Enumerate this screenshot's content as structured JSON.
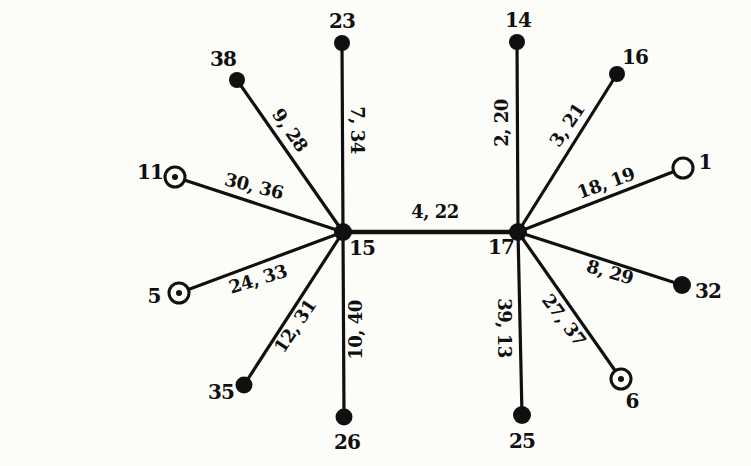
{
  "figure": {
    "type": "graph-diagram",
    "background_color": "#fcfcf9",
    "ink_color": "#101010"
  },
  "nodes": [
    {
      "id": "15",
      "label": "15",
      "x": 343,
      "y": 232,
      "style": "filled",
      "r": 9,
      "lx": 362,
      "ly": 248
    },
    {
      "id": "17",
      "label": "17",
      "x": 518,
      "y": 232,
      "style": "filled",
      "r": 9,
      "lx": 501,
      "ly": 247
    },
    {
      "id": "23",
      "label": "23",
      "x": 342,
      "y": 43,
      "style": "filled",
      "r": 8,
      "lx": 342,
      "ly": 21
    },
    {
      "id": "38",
      "label": "38",
      "x": 237,
      "y": 80,
      "style": "filled",
      "r": 8,
      "lx": 223,
      "ly": 59
    },
    {
      "id": "11",
      "label": "11",
      "x": 175,
      "y": 177,
      "style": "circled-dot",
      "r": 10,
      "lx": 150,
      "ly": 172
    },
    {
      "id": "5",
      "label": "5",
      "x": 179,
      "y": 293,
      "style": "circled-dot",
      "r": 10,
      "lx": 154,
      "ly": 296
    },
    {
      "id": "35",
      "label": "35",
      "x": 244,
      "y": 385,
      "style": "filled",
      "r": 8.5,
      "lx": 221,
      "ly": 392
    },
    {
      "id": "26",
      "label": "26",
      "x": 344,
      "y": 417,
      "style": "filled",
      "r": 8.5,
      "lx": 347,
      "ly": 442
    },
    {
      "id": "14",
      "label": "14",
      "x": 517,
      "y": 42,
      "style": "filled",
      "r": 8,
      "lx": 518,
      "ly": 20
    },
    {
      "id": "16",
      "label": "16",
      "x": 617,
      "y": 74,
      "style": "filled",
      "r": 8,
      "lx": 635,
      "ly": 57
    },
    {
      "id": "1",
      "label": "1",
      "x": 683,
      "y": 168,
      "style": "open",
      "r": 10,
      "lx": 705,
      "ly": 162
    },
    {
      "id": "32",
      "label": "32",
      "x": 682,
      "y": 285,
      "style": "filled",
      "r": 9,
      "lx": 708,
      "ly": 291
    },
    {
      "id": "6",
      "label": "6",
      "x": 621,
      "y": 379,
      "style": "circled-dot",
      "r": 10,
      "lx": 632,
      "ly": 401
    },
    {
      "id": "25",
      "label": "25",
      "x": 522,
      "y": 415,
      "style": "filled",
      "r": 9,
      "lx": 522,
      "ly": 441
    }
  ],
  "edges": [
    {
      "from": "15",
      "to": "17",
      "label": "4, 22",
      "lx": 435,
      "ly": 212,
      "rot": 0,
      "w": 4.4
    },
    {
      "from": "15",
      "to": "23",
      "label": "7, 34",
      "lx": 357,
      "ly": 130,
      "rot": 90,
      "w": 3.2
    },
    {
      "from": "15",
      "to": "38",
      "label": "9, 28",
      "lx": 290,
      "ly": 130,
      "rot": 55,
      "w": 3.2
    },
    {
      "from": "15",
      "to": "11",
      "label": "30, 36",
      "lx": 254,
      "ly": 186,
      "rot": 14,
      "w": 3.2
    },
    {
      "from": "15",
      "to": "5",
      "label": "24, 33",
      "lx": 258,
      "ly": 279,
      "rot": -17,
      "w": 3.2
    },
    {
      "from": "15",
      "to": "35",
      "label": "12, 31",
      "lx": 295,
      "ly": 326,
      "rot": -56,
      "w": 3.2
    },
    {
      "from": "15",
      "to": "26",
      "label": "10, 40",
      "lx": 356,
      "ly": 330,
      "rot": -90,
      "w": 3.2
    },
    {
      "from": "17",
      "to": "14",
      "label": "2, 20",
      "lx": 502,
      "ly": 123,
      "rot": -90,
      "w": 3.2
    },
    {
      "from": "17",
      "to": "16",
      "label": "3, 21",
      "lx": 567,
      "ly": 125,
      "rot": -56,
      "w": 3.2
    },
    {
      "from": "17",
      "to": "1",
      "label": "18, 19",
      "lx": 606,
      "ly": 183,
      "rot": -20,
      "w": 3.2
    },
    {
      "from": "17",
      "to": "32",
      "label": "8, 29",
      "lx": 610,
      "ly": 272,
      "rot": 16,
      "w": 3.2
    },
    {
      "from": "17",
      "to": "6",
      "label": "27, 37",
      "lx": 564,
      "ly": 320,
      "rot": 53,
      "w": 3.2
    },
    {
      "from": "17",
      "to": "25",
      "label": "39, 13",
      "lx": 504,
      "ly": 328,
      "rot": 90,
      "w": 3.2
    }
  ]
}
